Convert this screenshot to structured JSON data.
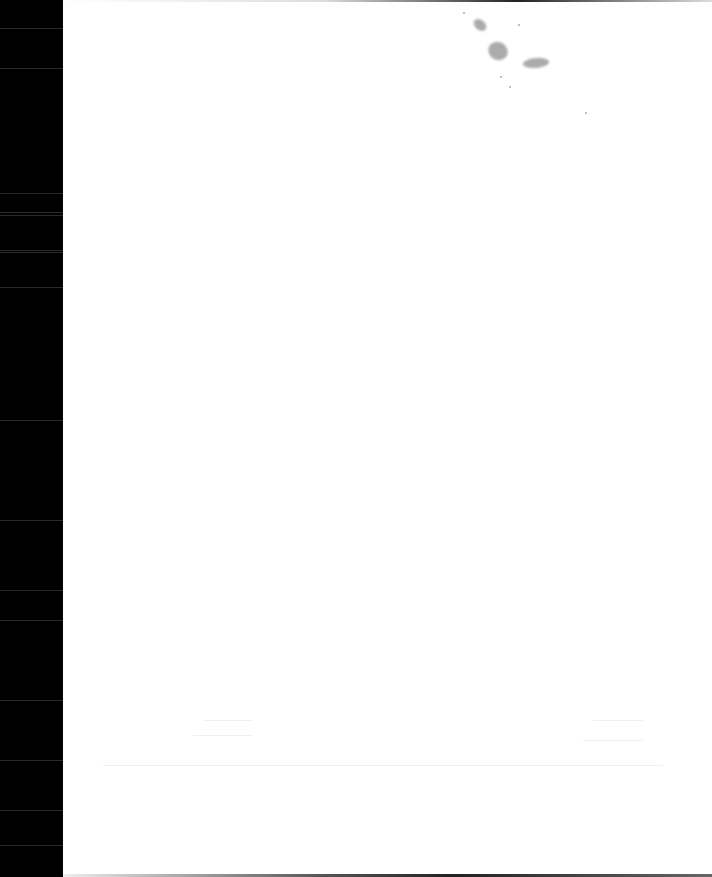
{
  "page": {
    "type": "blank scanned page",
    "background_color": "#ffffff",
    "scan_edge_color": "#000000",
    "ink_blot_color": "#8f8f8f"
  },
  "visible_text": []
}
